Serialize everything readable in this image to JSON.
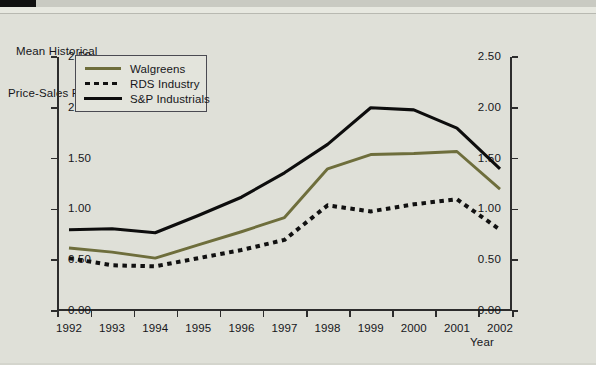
{
  "header": {
    "black_bar": "",
    "gray_strip": ""
  },
  "axis_title": {
    "line1": "Mean Historical",
    "line2": "Price-Sales Ratios"
  },
  "legend": {
    "items": [
      {
        "label": "Walgreens",
        "style": "solid",
        "color": "#6e6e3c"
      },
      {
        "label": "RDS Industry",
        "style": "dotted",
        "color": "#111111"
      },
      {
        "label": "S&P Industrials",
        "style": "solid",
        "color": "#0d0d0d"
      }
    ]
  },
  "xaxis_caption": "Year",
  "chart_data": {
    "type": "line",
    "title": "Mean Historical Price-Sales Ratios",
    "xlabel": "Year",
    "ylabel": "Mean Historical Price-Sales Ratios",
    "grid": false,
    "legend_position": "top-left-inside",
    "categories": [
      "1992",
      "1993",
      "1994",
      "1995",
      "1996",
      "1997",
      "1998",
      "1999",
      "2000",
      "2001",
      "2002"
    ],
    "x": [
      1992,
      1993,
      1994,
      1995,
      1996,
      1997,
      1998,
      1999,
      2000,
      2001,
      2002
    ],
    "ylim": [
      0.0,
      2.5
    ],
    "yticks": [
      "0.00",
      "0.50",
      "1.00",
      "1.50",
      "2.00",
      "2.50"
    ],
    "ytick_values": [
      0.0,
      0.5,
      1.0,
      1.5,
      2.0,
      2.5
    ],
    "yticks_right": [
      "0.00",
      "0.50",
      "1.00",
      "1.50",
      "2.00",
      "2.50"
    ],
    "series": [
      {
        "name": "Walgreens",
        "color": "#6e6e3c",
        "style": "solid",
        "values": [
          0.62,
          0.58,
          0.52,
          0.65,
          0.78,
          0.92,
          1.4,
          1.54,
          1.55,
          1.57,
          1.2
        ]
      },
      {
        "name": "RDS Industry",
        "color": "#111111",
        "style": "dotted",
        "values": [
          0.52,
          0.45,
          0.44,
          0.52,
          0.6,
          0.7,
          1.04,
          0.98,
          1.05,
          1.1,
          0.8
        ]
      },
      {
        "name": "S&P Industrials",
        "color": "#0d0d0d",
        "style": "solid",
        "values": [
          0.8,
          0.81,
          0.77,
          0.94,
          1.12,
          1.36,
          1.64,
          2.0,
          1.98,
          1.8,
          1.4
        ]
      }
    ]
  }
}
